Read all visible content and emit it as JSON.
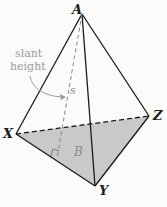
{
  "diagram": {
    "vertices": {
      "A": {
        "label": "A",
        "x": 82,
        "y": 14
      },
      "X": {
        "label": "X",
        "x": 16,
        "y": 134
      },
      "Y": {
        "label": "Y",
        "x": 95,
        "y": 186
      },
      "Z": {
        "label": "Z",
        "x": 149,
        "y": 116
      }
    },
    "base_label": "B",
    "slant_label": "s",
    "annotation": {
      "line1": "slant",
      "line2": "height"
    },
    "colors": {
      "base_fill": "#c9c9c7",
      "edge": "#1a1a1a",
      "annotation": "#9a9a9a"
    }
  }
}
